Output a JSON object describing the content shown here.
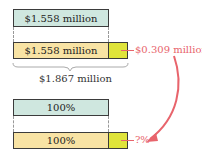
{
  "top_diagram": {
    "original_bar_label": "$1.558 million",
    "new_bar_label": "$1.558 million",
    "increase_label": "$0.309 million",
    "total_label": "$1.867 million"
  },
  "bottom_diagram": {
    "original_bar_label": "100%",
    "new_bar_label": "100%",
    "increase_label": "?%"
  },
  "colors": {
    "original_bar": "#cfe7df",
    "new_bar": "#f8e3a4",
    "increase_segment": "#dfe43a",
    "annotation": "#e8646c"
  }
}
